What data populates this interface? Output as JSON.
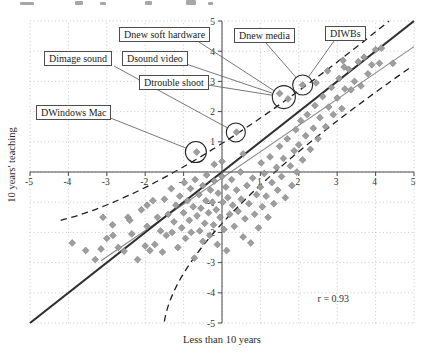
{
  "figure": {
    "correlation_label": "r = 0.93",
    "xlabel": "Less than 10 years",
    "ylabel": "10 years' teaching"
  },
  "chart_data": {
    "type": "scatter",
    "title": "",
    "xlabel": "Less than 10 years",
    "ylabel": "10 years' teaching",
    "xlim": [
      -5,
      5
    ],
    "ylim": [
      -5,
      5
    ],
    "x_ticks": [
      -5,
      -4,
      -3,
      -2,
      -1,
      1,
      2,
      3,
      4,
      5
    ],
    "y_ticks": [
      5,
      4,
      3,
      2,
      1,
      -1,
      -2,
      -3,
      -4,
      -5
    ],
    "grid": "dotted at every integer",
    "legend": "none",
    "annotation": {
      "text": "r = 0.93",
      "x": 2.9,
      "y": -4.3
    },
    "identity_line": {
      "x1": -5,
      "y1": -5,
      "x2": 5,
      "y2": 5
    },
    "regression_line": {
      "slope": 0.87,
      "intercept": -0.2,
      "x_start": -3.15,
      "x_end": 5.0
    },
    "prediction_band_upper": {
      "start": [
        -4.2,
        -1.6
      ],
      "mid": [
        -0.5,
        0.55
      ],
      "end": [
        4.35,
        5.0
      ]
    },
    "prediction_band_lower": {
      "start": [
        -1.5,
        -4.95
      ],
      "mid": [
        0.3,
        -1.3
      ],
      "end": [
        4.95,
        3.5
      ]
    },
    "circled_points": {
      "A": {
        "cx": 2.1,
        "cy": 2.88,
        "r_px": 10
      },
      "B": {
        "cx": 1.61,
        "cy": 2.48,
        "r_px": 11.5
      },
      "C": {
        "cx": 0.36,
        "cy": 1.31,
        "r_px": 9.5
      },
      "D": {
        "cx": -0.68,
        "cy": 0.66,
        "r_px": 10.5
      }
    },
    "callouts": [
      {
        "label": "Dnew soft hardware",
        "box": [
          119,
          27
        ],
        "from": [
          199,
          42
        ],
        "circle": "B"
      },
      {
        "label": "Dnew media",
        "box": [
          234,
          28
        ],
        "from": [
          266,
          43
        ],
        "circle": "A"
      },
      {
        "label": "DIWBs",
        "box": [
          325,
          26
        ],
        "from": [
          334,
          41
        ],
        "circle": "A"
      },
      {
        "label": "Dimage sound",
        "box": [
          44,
          51
        ],
        "from": [
          114,
          66
        ],
        "circle": "C"
      },
      {
        "label": "Dsound video",
        "box": [
          122,
          51
        ],
        "from": [
          186,
          64
        ],
        "circle": "B"
      },
      {
        "label": "Dtrouble shoot",
        "box": [
          139,
          75
        ],
        "from": [
          208,
          85
        ],
        "circle": "B"
      },
      {
        "label": "DWindows Mac",
        "box": [
          36,
          105
        ],
        "from": [
          108,
          117
        ],
        "circle": "D"
      }
    ],
    "points": [
      [
        -3.9,
        -2.35
      ],
      [
        -3.55,
        -2.6
      ],
      [
        -3.3,
        -2.9
      ],
      [
        -3.15,
        -2.55
      ],
      [
        -3.1,
        -1.5
      ],
      [
        -3.0,
        -2.2
      ],
      [
        -2.85,
        -1.75
      ],
      [
        -2.84,
        -2.1
      ],
      [
        -2.7,
        -2.5
      ],
      [
        -2.55,
        -2.62
      ],
      [
        -2.45,
        -1.5
      ],
      [
        -2.4,
        -1.6
      ],
      [
        -2.35,
        -2.05
      ],
      [
        -2.2,
        -2.9
      ],
      [
        -2.1,
        -1.25
      ],
      [
        -2.0,
        -2.45
      ],
      [
        -1.95,
        -1.8
      ],
      [
        -1.95,
        -1.1
      ],
      [
        -1.88,
        -2.6
      ],
      [
        -1.8,
        -0.95
      ],
      [
        -1.75,
        -2.4
      ],
      [
        -1.68,
        -1.5
      ],
      [
        -1.6,
        -1.95
      ],
      [
        -1.55,
        -2.65
      ],
      [
        -1.5,
        -0.9
      ],
      [
        -1.45,
        -2.1
      ],
      [
        -1.4,
        -1.4
      ],
      [
        -1.32,
        -0.55
      ],
      [
        -1.3,
        -2.0
      ],
      [
        -1.25,
        -1.65
      ],
      [
        -1.2,
        -1.1
      ],
      [
        -1.15,
        -2.5
      ],
      [
        -1.1,
        -0.8
      ],
      [
        -1.05,
        -1.85
      ],
      [
        -1.0,
        -1.35
      ],
      [
        -0.98,
        -0.35
      ],
      [
        -0.95,
        -2.2
      ],
      [
        -0.9,
        -0.95
      ],
      [
        -0.85,
        -1.6
      ],
      [
        -0.82,
        -0.55
      ],
      [
        -0.8,
        -2.0
      ],
      [
        -0.75,
        -1.15
      ],
      [
        -0.72,
        -2.85
      ],
      [
        -0.7,
        -0.25
      ],
      [
        -0.65,
        -1.45
      ],
      [
        -0.6,
        -0.75
      ],
      [
        -0.58,
        -1.95
      ],
      [
        -0.55,
        -1.2
      ],
      [
        -0.5,
        -0.45
      ],
      [
        -0.5,
        -2.3
      ],
      [
        -0.45,
        -1.7
      ],
      [
        -0.42,
        -0.95
      ],
      [
        -0.4,
        -0.1
      ],
      [
        -0.35,
        -1.35
      ],
      [
        -0.32,
        -2.1
      ],
      [
        -0.3,
        -0.6
      ],
      [
        -0.25,
        -1.0
      ],
      [
        -0.22,
        -1.75
      ],
      [
        -0.2,
        -0.3
      ],
      [
        -0.15,
        -1.25
      ],
      [
        -0.12,
        -2.4
      ],
      [
        -0.1,
        -0.7
      ],
      [
        -0.05,
        -1.5
      ],
      [
        0.0,
        -0.15
      ],
      [
        0.02,
        -1.0
      ],
      [
        0.05,
        -1.9
      ],
      [
        0.1,
        -0.5
      ],
      [
        0.12,
        -2.6
      ],
      [
        0.15,
        -0.85
      ],
      [
        0.2,
        -1.4
      ],
      [
        0.25,
        -0.25
      ],
      [
        0.28,
        -1.1
      ],
      [
        0.32,
        -1.8
      ],
      [
        0.38,
        -0.6
      ],
      [
        0.42,
        -1.3
      ],
      [
        0.48,
        0.0
      ],
      [
        0.5,
        -0.9
      ],
      [
        0.55,
        -2.15
      ],
      [
        0.6,
        -1.55
      ],
      [
        0.65,
        -0.45
      ],
      [
        0.7,
        -1.05
      ],
      [
        0.75,
        -2.35
      ],
      [
        0.8,
        -0.2
      ],
      [
        0.85,
        -1.4
      ],
      [
        0.9,
        -0.75
      ],
      [
        0.95,
        -1.85
      ],
      [
        1.0,
        -0.5
      ],
      [
        1.02,
        0.3
      ],
      [
        1.05,
        -1.15
      ],
      [
        1.1,
        -0.05
      ],
      [
        1.15,
        -0.8
      ],
      [
        1.2,
        -1.5
      ],
      [
        1.25,
        0.5
      ],
      [
        1.3,
        -0.35
      ],
      [
        1.35,
        -1.05
      ],
      [
        1.42,
        0.15
      ],
      [
        1.45,
        -0.6
      ],
      [
        1.5,
        0.85
      ],
      [
        1.55,
        -0.15
      ],
      [
        1.6,
        0.45
      ],
      [
        1.65,
        -0.85
      ],
      [
        1.7,
        1.1
      ],
      [
        1.78,
        0.2
      ],
      [
        1.82,
        -0.45
      ],
      [
        1.88,
        0.7
      ],
      [
        1.92,
        1.4
      ],
      [
        1.95,
        0.0
      ],
      [
        2.0,
        0.9
      ],
      [
        2.05,
        1.7
      ],
      [
        2.1,
        0.4
      ],
      [
        2.18,
        1.2
      ],
      [
        2.22,
        1.9
      ],
      [
        2.3,
        0.75
      ],
      [
        2.38,
        1.45
      ],
      [
        2.42,
        2.2
      ],
      [
        2.5,
        1.1
      ],
      [
        2.55,
        1.8
      ],
      [
        2.62,
        2.5
      ],
      [
        2.7,
        1.5
      ],
      [
        2.78,
        2.15
      ],
      [
        2.85,
        2.8
      ],
      [
        2.9,
        1.9
      ],
      [
        3.0,
        2.45
      ],
      [
        3.05,
        3.1
      ],
      [
        3.12,
        2.1
      ],
      [
        3.2,
        2.75
      ],
      [
        3.3,
        3.4
      ],
      [
        3.36,
        2.72
      ],
      [
        3.45,
        3.0
      ],
      [
        3.55,
        3.65
      ],
      [
        3.62,
        2.85
      ],
      [
        3.7,
        3.8
      ],
      [
        3.8,
        3.25
      ],
      [
        3.9,
        3.55
      ],
      [
        4.0,
        4.05
      ],
      [
        4.1,
        3.6
      ],
      [
        4.15,
        4.1
      ],
      [
        4.45,
        3.6
      ],
      [
        3.18,
        3.48
      ],
      [
        0.0,
        0.35
      ],
      [
        0.55,
        0.6
      ],
      [
        -0.2,
        0.25
      ],
      [
        2.75,
        3.35
      ],
      [
        3.15,
        3.7
      ],
      [
        2.45,
        2.95
      ],
      [
        2.1,
        2.88
      ],
      [
        1.5,
        2.6
      ],
      [
        1.72,
        2.42
      ],
      [
        0.38,
        1.32
      ],
      [
        -0.66,
        0.66
      ]
    ]
  },
  "caption_fragments": [
    [
      20,
      2,
      14,
      3
    ],
    [
      75,
      1,
      8,
      4
    ],
    [
      100,
      2,
      6,
      3
    ],
    [
      145,
      1,
      7,
      4
    ],
    [
      186,
      0,
      10,
      5
    ],
    [
      208,
      2,
      5,
      3
    ]
  ]
}
